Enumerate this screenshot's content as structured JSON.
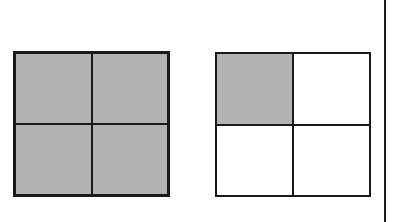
{
  "diagram": {
    "colors": {
      "shaded": "#b3b3b3",
      "unshaded": "#ffffff",
      "line": "#1a1a1a"
    },
    "grids": [
      {
        "id": "left",
        "cells": [
          true,
          true,
          true,
          true
        ]
      },
      {
        "id": "right",
        "cells": [
          true,
          false,
          false,
          false
        ]
      }
    ]
  }
}
